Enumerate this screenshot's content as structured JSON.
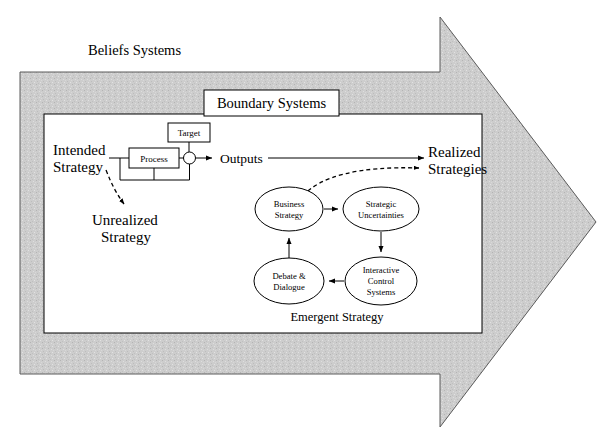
{
  "diagram": {
    "title_outer": "Beliefs Systems",
    "title_boundary": "Boundary Systems",
    "accent_fill": "#c9c9c9",
    "stroke_color": "#000000",
    "labels": {
      "intended_strategy_line1": "Intended",
      "intended_strategy_line2": "Strategy",
      "unrealized_strategy_line1": "Unrealized",
      "unrealized_strategy_line2": "Strategy",
      "realized_strategies_line1": "Realized",
      "realized_strategies_line2": "Strategies",
      "target": "Target",
      "process": "Process",
      "outputs": "Outputs",
      "emergent_strategy": "Emergent Strategy"
    },
    "cycle_nodes": [
      {
        "id": "business-strategy",
        "line1": "Business",
        "line2": "Strategy",
        "line3": ""
      },
      {
        "id": "strategic-uncertainties",
        "line1": "Strategic",
        "line2": "Uncertainties",
        "line3": ""
      },
      {
        "id": "interactive-control-systems",
        "line1": "Interactive",
        "line2": "Control",
        "line3": "Systems"
      },
      {
        "id": "debate-and-dialogue",
        "line1": "Debate &",
        "line2": "Dialogue",
        "line3": ""
      }
    ]
  }
}
